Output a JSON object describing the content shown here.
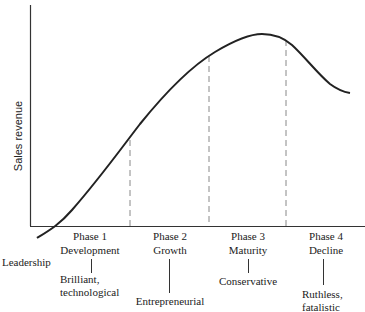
{
  "diagram": {
    "y_axis_label": "Sales revenue",
    "row_label": "Leadership",
    "phases": [
      {
        "phase": "Phase 1",
        "name": "Development",
        "leadership": "Brilliant,\ntechnological"
      },
      {
        "phase": "Phase 2",
        "name": "Growth",
        "leadership": "Entrepreneurial"
      },
      {
        "phase": "Phase 3",
        "name": "Maturity",
        "leadership": "Conservative"
      },
      {
        "phase": "Phase 4",
        "name": "Decline",
        "leadership": "Ruthless,\nfatalistic"
      }
    ],
    "colors": {
      "line": "#222222",
      "dash": "#888888",
      "axis": "#333333"
    }
  }
}
